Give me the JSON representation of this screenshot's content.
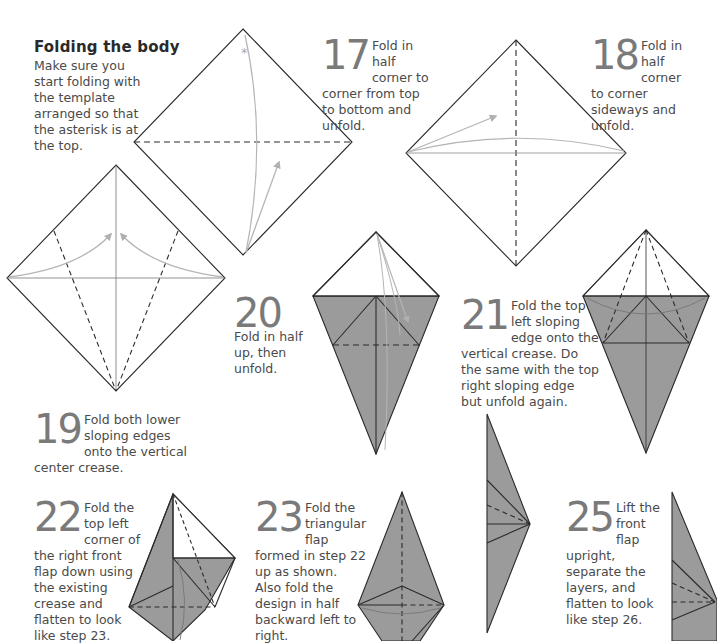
{
  "section": {
    "title": "Folding the body",
    "intro": "Make sure you start folding with the template arranged so that the asterisk is at the top."
  },
  "steps": [
    {
      "number": "17",
      "lead": "Fold in half corner to",
      "rest": "corner from top to bottom and unfold."
    },
    {
      "number": "18",
      "lead": "Fold in half corner to",
      "rest": "corner sideways and unfold."
    },
    {
      "number": "19",
      "lead": "Fold both lower sloping edges onto the vertical",
      "rest": "center crease."
    },
    {
      "number": "20",
      "lead": "Fold in half up,",
      "rest": "then unfold."
    },
    {
      "number": "21",
      "lead": "Fold the top left sloping",
      "rest": "edge onto the vertical crease. Do the same with the top right sloping edge but unfold again."
    },
    {
      "number": "22",
      "lead": "Fold the top left corner",
      "rest": "of the right front flap down using the existing crease and flatten to look like step 23."
    },
    {
      "number": "23",
      "lead": "Fold the triangular flap",
      "rest": "formed in step 22 up as shown. Also fold the design in half backward left to right."
    },
    {
      "number": "25",
      "lead": "Lift the front flap",
      "rest": "upright, separate the layers, and flatten to look like step 26."
    }
  ],
  "symbols": {
    "asterisk": "*"
  },
  "colors": {
    "paper_shade": "#9b9b9b",
    "line": "#2b2b2b",
    "arrow": "#b5b5b5",
    "step_number": "#7a7a7a"
  }
}
